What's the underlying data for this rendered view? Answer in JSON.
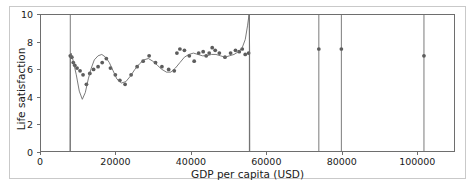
{
  "chart_data": {
    "type": "scatter",
    "title": "",
    "xlabel": "GDP per capita (USD)",
    "ylabel": "Life satisfaction",
    "xlim": [
      0,
      110000
    ],
    "ylim": [
      0,
      10
    ],
    "xticks": [
      0,
      20000,
      40000,
      60000,
      80000,
      100000
    ],
    "xticklabels": [
      "0",
      "20000",
      "40000",
      "60000",
      "80000",
      "100000"
    ],
    "yticks": [
      0,
      2,
      4,
      6,
      8,
      10
    ],
    "yticklabels": [
      "0",
      "2",
      "4",
      "6",
      "8",
      "10"
    ],
    "grid": false,
    "legend": null,
    "marker_color": "#5c5c5c",
    "line_color": "#6b6b6b",
    "axes_color": "#6e6e6e",
    "background_color": "#ffffff",
    "series": [
      {
        "name": "countries",
        "kind": "scatter",
        "x": [
          7800,
          8200,
          8600,
          9000,
          9600,
          10400,
          11200,
          12100,
          13000,
          14000,
          15200,
          16300,
          17400,
          18500,
          19800,
          21000,
          22400,
          24000,
          25600,
          27200,
          28800,
          30500,
          32200,
          34000,
          35500,
          36200,
          37000,
          38200,
          39500,
          40800,
          42000,
          43200,
          44000,
          44800,
          45600,
          46400,
          47500,
          49000,
          50500,
          51800,
          52800,
          53600,
          54400,
          55300,
          74000,
          80000,
          102000
        ],
        "y": [
          7.0,
          6.9,
          6.5,
          6.3,
          6.1,
          5.9,
          5.6,
          4.9,
          5.7,
          6.0,
          6.2,
          6.5,
          6.8,
          6.1,
          5.6,
          5.2,
          4.9,
          5.6,
          6.2,
          6.6,
          7.0,
          6.5,
          6.2,
          6.0,
          5.9,
          7.2,
          7.5,
          7.4,
          7.0,
          6.6,
          7.2,
          7.3,
          7.0,
          7.2,
          7.6,
          7.4,
          7.2,
          6.9,
          7.2,
          7.4,
          7.3,
          7.5,
          7.1,
          7.2,
          7.5,
          7.5,
          7.0
        ]
      },
      {
        "name": "polynomial fit (overfitting)",
        "kind": "line",
        "note": "high-degree polynomial with near-vertical excursions at the data edges",
        "x": [
          7750,
          7800,
          8000,
          8600,
          9400,
          10200,
          11000,
          11800,
          12600,
          13400,
          14200,
          15200,
          16200,
          17200,
          18200,
          19200,
          20200,
          21400,
          22600,
          23800,
          25000,
          26200,
          27400,
          28600,
          29800,
          31000,
          32200,
          33400,
          34600,
          35800,
          37000,
          38200,
          39400,
          40600,
          41800,
          43000,
          44200,
          45400,
          46600,
          47800,
          49000,
          50200,
          51400,
          52600,
          53600,
          54400,
          55000,
          55400,
          55500,
          55560,
          55600
        ],
        "y": [
          0.0,
          6.9,
          7.2,
          6.6,
          5.6,
          4.4,
          3.8,
          4.3,
          5.3,
          6.1,
          6.7,
          7.0,
          7.1,
          6.9,
          6.5,
          5.9,
          5.3,
          5.0,
          5.1,
          5.5,
          6.0,
          6.4,
          6.7,
          6.8,
          6.6,
          6.3,
          6.0,
          5.8,
          5.8,
          6.1,
          6.5,
          6.9,
          7.1,
          7.2,
          7.1,
          7.0,
          7.0,
          7.1,
          7.1,
          7.0,
          6.9,
          7.0,
          7.1,
          7.3,
          7.6,
          8.2,
          9.2,
          10.0,
          9.0,
          7.4,
          0.0
        ]
      }
    ],
    "vertical_spikes": [
      {
        "x": 7800,
        "label": "left asymptote"
      },
      {
        "x": 55500,
        "label": "right asymptote"
      },
      {
        "x": 74000,
        "label": "spike at isolated point"
      },
      {
        "x": 80000,
        "label": "spike at isolated point"
      },
      {
        "x": 102000,
        "label": "spike at isolated point"
      }
    ]
  }
}
